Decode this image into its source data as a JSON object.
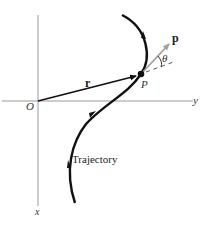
{
  "figure": {
    "axes": {
      "origin_label": "O",
      "horizontal_axis_label": "y",
      "vertical_axis_label": "x",
      "axis_color": "#9a9a9a"
    },
    "point": {
      "label": "P"
    },
    "position_vector": {
      "label": "r"
    },
    "momentum_vector": {
      "label": "p",
      "color": "#a0a0a0"
    },
    "angle": {
      "label": "θ"
    },
    "trajectory": {
      "label": "Trajectory",
      "color": "#111111"
    }
  }
}
